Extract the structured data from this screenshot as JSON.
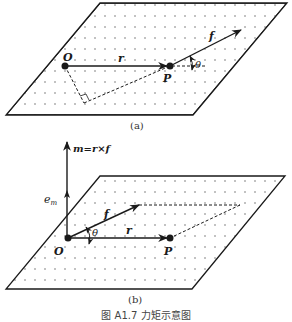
{
  "figure": {
    "caption": "图 A1.7   力矩示意图",
    "panels": [
      {
        "id": "a",
        "label": "(a)",
        "points": {
          "O": "O",
          "P": "P"
        },
        "vectors": {
          "r": "r",
          "f": "f"
        },
        "angle": "θ"
      },
      {
        "id": "b",
        "label": "(b)",
        "points": {
          "O": "O",
          "P": "P"
        },
        "vectors": {
          "r": "r",
          "f": "f",
          "m": "m=r×f",
          "e": "e",
          "e_sub": "m"
        },
        "angle": "θ"
      }
    ]
  },
  "colors": {
    "ink": "#1a1a1a",
    "dots": "#555555",
    "background": "#ffffff"
  }
}
